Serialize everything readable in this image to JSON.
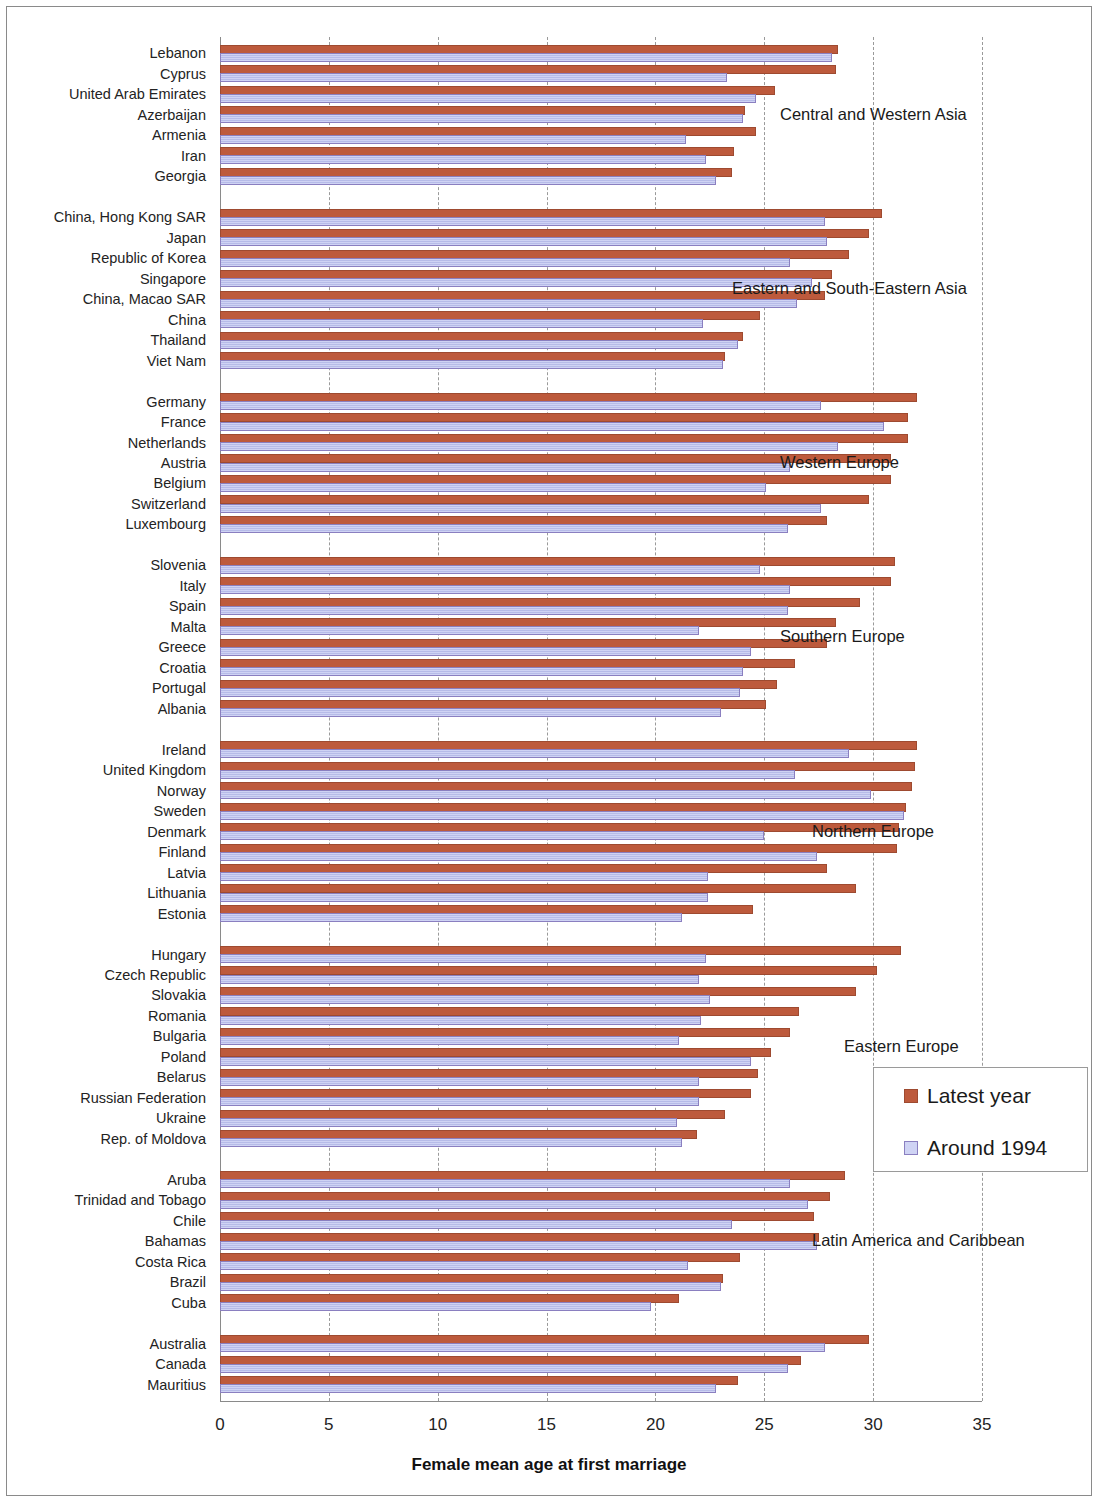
{
  "chart_data": {
    "type": "bar",
    "orientation": "horizontal",
    "title": "",
    "xlabel": "Female mean age at first  marriage",
    "ylabel": "",
    "xlim": [
      0,
      35
    ],
    "xticks": [
      0,
      5,
      10,
      15,
      20,
      25,
      30,
      35
    ],
    "grid": true,
    "legend_position": "right-middle",
    "colors": {
      "latest_year": "#bd5a3c",
      "around_1994": "#cfd3f4"
    },
    "series": [
      {
        "name": "Latest year",
        "key": "latest"
      },
      {
        "name": "Around 1994",
        "key": "around1994"
      }
    ],
    "groups": [
      {
        "label": "Central and Western Asia",
        "rows": [
          {
            "country": "Lebanon",
            "latest": 28.4,
            "around1994": 28.1
          },
          {
            "country": "Cyprus",
            "latest": 28.3,
            "around1994": 23.3
          },
          {
            "country": "United Arab Emirates",
            "latest": 25.5,
            "around1994": 24.6
          },
          {
            "country": "Azerbaijan",
            "latest": 24.1,
            "around1994": 24.0
          },
          {
            "country": "Armenia",
            "latest": 24.6,
            "around1994": 21.4
          },
          {
            "country": "Iran",
            "latest": 23.6,
            "around1994": 22.3
          },
          {
            "country": "Georgia",
            "latest": 23.5,
            "around1994": 22.8
          }
        ]
      },
      {
        "label": "Eastern and South-Eastern Asia",
        "rows": [
          {
            "country": "China, Hong Kong SAR",
            "latest": 30.4,
            "around1994": 27.8
          },
          {
            "country": "Japan",
            "latest": 29.8,
            "around1994": 27.9
          },
          {
            "country": "Republic of Korea",
            "latest": 28.9,
            "around1994": 26.2
          },
          {
            "country": "Singapore",
            "latest": 28.1,
            "around1994": 27.2
          },
          {
            "country": "China, Macao SAR",
            "latest": 27.8,
            "around1994": 26.5
          },
          {
            "country": "China",
            "latest": 24.8,
            "around1994": 22.2
          },
          {
            "country": "Thailand",
            "latest": 24.0,
            "around1994": 23.8
          },
          {
            "country": "Viet Nam",
            "latest": 23.2,
            "around1994": 23.1
          }
        ]
      },
      {
        "label": "Western Europe",
        "rows": [
          {
            "country": "Germany",
            "latest": 32.0,
            "around1994": 27.6
          },
          {
            "country": "France",
            "latest": 31.6,
            "around1994": 30.5
          },
          {
            "country": "Netherlands",
            "latest": 31.6,
            "around1994": 28.4
          },
          {
            "country": "Austria",
            "latest": 30.8,
            "around1994": 26.2
          },
          {
            "country": "Belgium",
            "latest": 30.8,
            "around1994": 25.1
          },
          {
            "country": "Switzerland",
            "latest": 29.8,
            "around1994": 27.6
          },
          {
            "country": "Luxembourg",
            "latest": 27.9,
            "around1994": 26.1
          }
        ]
      },
      {
        "label": "Southern Europe",
        "rows": [
          {
            "country": "Slovenia",
            "latest": 31.0,
            "around1994": 24.8
          },
          {
            "country": "Italy",
            "latest": 30.8,
            "around1994": 26.2
          },
          {
            "country": "Spain",
            "latest": 29.4,
            "around1994": 26.1
          },
          {
            "country": "Malta",
            "latest": 28.3,
            "around1994": 22.0
          },
          {
            "country": "Greece",
            "latest": 27.9,
            "around1994": 24.4
          },
          {
            "country": "Croatia",
            "latest": 26.4,
            "around1994": 24.0
          },
          {
            "country": "Portugal",
            "latest": 25.6,
            "around1994": 23.9
          },
          {
            "country": "Albania",
            "latest": 25.1,
            "around1994": 23.0
          }
        ]
      },
      {
        "label": "Northern Europe",
        "rows": [
          {
            "country": "Ireland",
            "latest": 32.0,
            "around1994": 28.9
          },
          {
            "country": "United Kingdom",
            "latest": 31.9,
            "around1994": 26.4
          },
          {
            "country": "Norway",
            "latest": 31.8,
            "around1994": 29.9
          },
          {
            "country": "Sweden",
            "latest": 31.5,
            "around1994": 31.4
          },
          {
            "country": "Denmark",
            "latest": 31.2,
            "around1994": 25.0
          },
          {
            "country": "Finland",
            "latest": 31.1,
            "around1994": 27.4
          },
          {
            "country": "Latvia",
            "latest": 27.9,
            "around1994": 22.4
          },
          {
            "country": "Lithuania",
            "latest": 29.2,
            "around1994": 22.4
          },
          {
            "country": "Estonia",
            "latest": 24.5,
            "around1994": 21.2
          }
        ]
      },
      {
        "label": "Eastern Europe",
        "rows": [
          {
            "country": "Hungary",
            "latest": 31.3,
            "around1994": 22.3
          },
          {
            "country": "Czech Republic",
            "latest": 30.2,
            "around1994": 22.0
          },
          {
            "country": "Slovakia",
            "latest": 29.2,
            "around1994": 22.5
          },
          {
            "country": "Romania",
            "latest": 26.6,
            "around1994": 22.1
          },
          {
            "country": "Bulgaria",
            "latest": 26.2,
            "around1994": 21.1
          },
          {
            "country": "Poland",
            "latest": 25.3,
            "around1994": 24.4
          },
          {
            "country": "Belarus",
            "latest": 24.7,
            "around1994": 22.0
          },
          {
            "country": "Russian Federation",
            "latest": 24.4,
            "around1994": 22.0
          },
          {
            "country": "Ukraine",
            "latest": 23.2,
            "around1994": 21.0
          },
          {
            "country": "Rep. of Moldova",
            "latest": 21.9,
            "around1994": 21.2
          }
        ]
      },
      {
        "label": "Latin America and Caribbean",
        "rows": [
          {
            "country": "Aruba",
            "latest": 28.7,
            "around1994": 26.2
          },
          {
            "country": "Trinidad and Tobago",
            "latest": 28.0,
            "around1994": 27.0
          },
          {
            "country": "Chile",
            "latest": 27.3,
            "around1994": 23.5
          },
          {
            "country": "Bahamas",
            "latest": 27.5,
            "around1994": 27.4
          },
          {
            "country": "Costa Rica",
            "latest": 23.9,
            "around1994": 21.5
          },
          {
            "country": "Brazil",
            "latest": 23.1,
            "around1994": 23.0
          },
          {
            "country": "Cuba",
            "latest": 21.1,
            "around1994": 19.8
          }
        ]
      },
      {
        "label": "",
        "rows": [
          {
            "country": "Australia",
            "latest": 29.8,
            "around1994": 27.8
          },
          {
            "country": "Canada",
            "latest": 26.7,
            "around1994": 26.1
          },
          {
            "country": "Mauritius",
            "latest": 23.8,
            "around1994": 22.8
          }
        ]
      }
    ]
  },
  "legend": {
    "items": [
      {
        "label": "Latest year",
        "color": "#bd5a3c",
        "kind": "red"
      },
      {
        "label": "Around 1994",
        "color": "#cfd3f4",
        "kind": "blue"
      }
    ]
  }
}
